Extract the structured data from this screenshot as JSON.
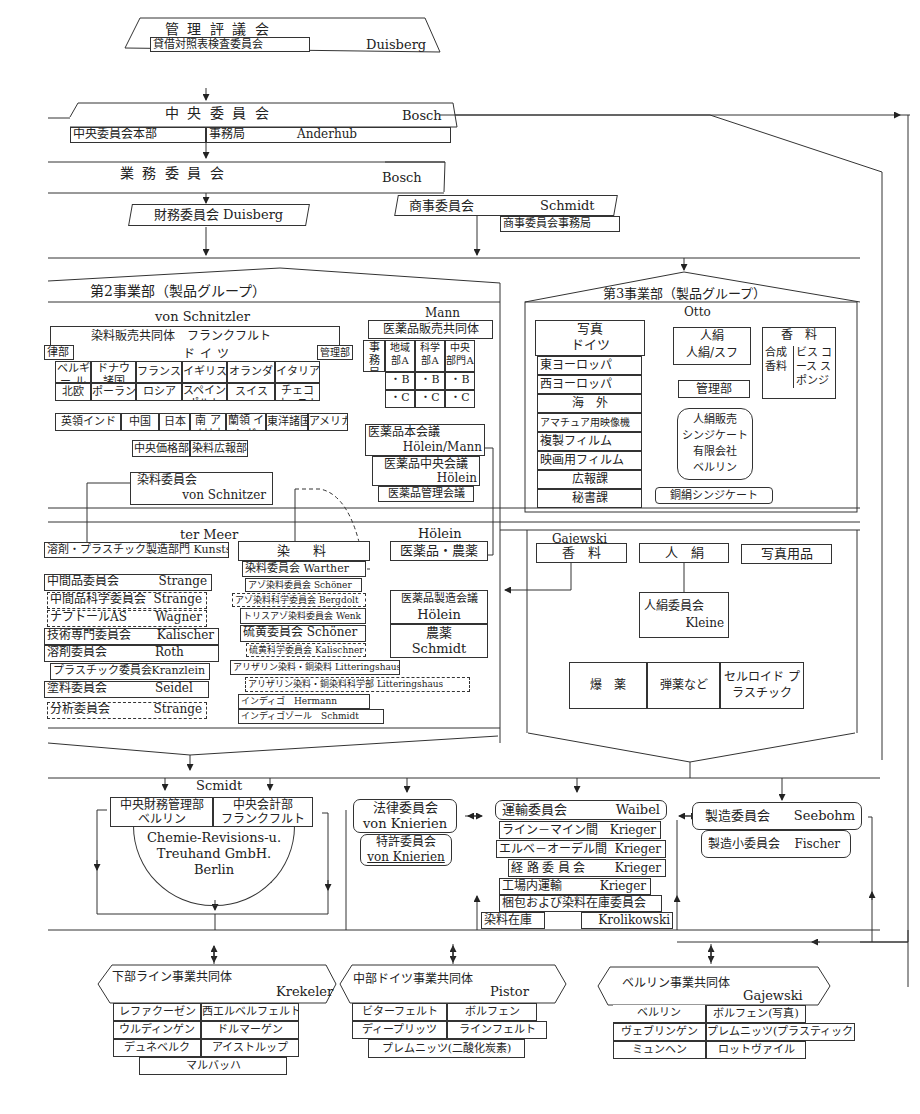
{
  "top": {
    "mgmt_council": {
      "title": "管理評議会",
      "sub": "貸借対照表検査委員会",
      "head": "Duisberg"
    },
    "central_committee": {
      "title": "中央委員会",
      "head": "Bosch",
      "hq": "中央委員会本部",
      "office": "事務局",
      "office_head": "Anderhub"
    },
    "business_committee": {
      "title": "業務委員会",
      "head": "Bosch"
    },
    "finance_committee": {
      "title": "財務委員会",
      "head": "Duisberg"
    },
    "commerce_committee": {
      "title": "商事委員会",
      "head": "Schmidt",
      "office": "商事委員会事務局"
    }
  },
  "div2": {
    "title": "第2事業部（製品グループ）",
    "head": "von Schnitzler",
    "dye_sales": {
      "title": "染料販売共同体　フランクフルト",
      "legal": "律部",
      "germany": "ドイツ",
      "admin": "管理部",
      "row1": [
        "ベルギー ルクセンブルク",
        "ドナウ 諸国",
        "フランス",
        "イギリス",
        "オランダ",
        "イタリア"
      ],
      "row2": [
        "北欧",
        "ポーランド",
        "ロシア",
        "スペイン ポルトガル",
        "スイス",
        "チェコ オーストリア"
      ],
      "row3": [
        "英領インド",
        "中国",
        "日本",
        "南 アメリカ",
        "蘭領 インド",
        "東洋諸国",
        "アメリカ"
      ],
      "row4": [
        "中央価格部",
        "染料広報部"
      ]
    },
    "pharma": {
      "head": "Mann",
      "title": "医薬品販売共同体",
      "cols": [
        "事務局",
        "地域部A",
        "科学部A",
        "中央部門A"
      ],
      "row_b": [
        "・B",
        "・B",
        "・B"
      ],
      "row_c": [
        "・C",
        "・C",
        "・C"
      ],
      "council": "医薬品本会議",
      "council_head": "Hölein/Mann",
      "central": "医薬品中央会議",
      "central_head": "Hölein",
      "mgmt": "医薬品管理会議"
    },
    "dye_committee": {
      "title": "染料委員会",
      "head": "von Schnitzer"
    }
  },
  "div3": {
    "title": "第3事業部（製品グループ）",
    "head": "Otto",
    "photo": {
      "title": "写真",
      "sub": "ドイツ",
      "items": [
        "東ヨーロッパ",
        "西ヨーロッパ",
        "海　外",
        "アマチュア用映像機",
        "複製フィルム",
        "映画用フィルム",
        "広報課",
        "秘書課"
      ]
    },
    "rayon": {
      "title": "人絹",
      "sub": "人絹/スフ"
    },
    "fragrance": {
      "title": "香　料",
      "left": "合成 香料",
      "right": "ビス コース スポンジ"
    },
    "admin": "管理部",
    "rayon_sales": [
      "人絹販売",
      "シンジケート",
      "有限会社",
      "ベルリン"
    ],
    "copper_rayon": "銅絹シンジケート"
  },
  "div1": {
    "head": "ter Meer",
    "solvent_plastic": "溶剤・プラスチック製造部門 Kunstst",
    "committees": [
      {
        "name": "中間品委員会",
        "head": "Strange",
        "dashed": false
      },
      {
        "name": "中間品科学委員会",
        "head": "Strange",
        "dashed": true
      },
      {
        "name": "ナフトールAS",
        "head": "Wagner",
        "dashed": true
      },
      {
        "name": "技術専門委員会",
        "head": "Kalischer",
        "dashed": false
      },
      {
        "name": "溶剤委員会",
        "head": "Roth",
        "dashed": false
      },
      {
        "name": "プラスチック委員会",
        "head": "Kranzlein",
        "dashed": false
      },
      {
        "name": "塗料委員会",
        "head": "Seidel",
        "dashed": false
      },
      {
        "name": "分析委員会",
        "head": "Strange",
        "dashed": true
      }
    ],
    "dyes": {
      "title": "染　料",
      "items": [
        {
          "name": "染料委員会",
          "head": "Warther"
        },
        {
          "name": "アゾ染料委員会",
          "head": "Schöner"
        },
        {
          "name": "アゾ染料科学委員会",
          "head": "Bergdolt"
        },
        {
          "name": "トリスアゾ染料委員会",
          "head": "Wenk"
        },
        {
          "name": "硫黄委員会",
          "head": "Schöner"
        },
        {
          "name": "硫黄科学委員会",
          "head": "Kalischner"
        },
        {
          "name": "アリザリン染料・銅染料",
          "head": "Litteringshaus"
        },
        {
          "name": "アリザリン染料・銅染料科学部",
          "head": "Litteringshaus"
        },
        {
          "name": "インディゴ",
          "head": "Hermann"
        },
        {
          "name": "インディゴゾール",
          "head": "Schmidt"
        }
      ]
    },
    "pharma_agri": {
      "head": "Hölein",
      "title": "医薬品・農薬",
      "mfg": "医薬品製造会議",
      "mfg_head": "Hölein",
      "agri": "農薬",
      "agri_head": "Schmidt"
    },
    "gajewski": {
      "head": "Gajewski",
      "fragrance": "香　料",
      "rayon": "人　絹",
      "photo": "写真用品",
      "rayon_comm": "人絹委員会",
      "rayon_head": "Kleine",
      "explosives": "爆　薬",
      "ammo": "弾薬など",
      "celluloid": "セルロイド プラスチック"
    }
  },
  "lower": {
    "finance": {
      "head": "Scmidt",
      "central_fin": "中央財務管理部",
      "central_fin_city": "ベルリン",
      "central_acct": "中央会計部",
      "central_acct_city": "フランクフルト",
      "trust": [
        "Chemie-Revisions-u.",
        "Treuhand GmbH.",
        "Berlin"
      ]
    },
    "legal": {
      "title": "法律委員会",
      "head": "von Knierien",
      "patent": "特許委員会",
      "patent_head": "von Knierien"
    },
    "transport": {
      "title": "運輸委員会",
      "head": "Waibel",
      "items": [
        {
          "name": "ライン－マイン間",
          "head": "Krieger"
        },
        {
          "name": "エルベ－オーデル間",
          "head": "Krieger"
        },
        {
          "name": "経路委員会",
          "head": "Krieger"
        },
        {
          "name": "工場内運輸",
          "head": "Krieger"
        }
      ],
      "packing": "梱包および染料在庫委員会",
      "stock": "染料在庫",
      "stock_head": "Krolikowski"
    },
    "manufacturing": {
      "title": "製造委員会",
      "head": "Seebohm",
      "sub": "製造小委員会",
      "sub_head": "Fischer"
    }
  },
  "regions": [
    {
      "title": "下部ライン事業共同体",
      "head": "Krekeler",
      "rows": [
        [
          "レファクーゼン",
          "西エルベルフェルト"
        ],
        [
          "ウルディンゲン",
          "ドルマーゲン"
        ],
        [
          "デュネベルク",
          "アイストルップ"
        ]
      ],
      "extra": "マルバッハ"
    },
    {
      "title": "中部ドイツ事業共同体",
      "head": "Pistor",
      "rows": [
        [
          "ビターフェルト",
          "ボルフェン"
        ],
        [
          "ディープリッツ",
          "ラインフェルト"
        ]
      ],
      "extra": "プレムニッツ(二酸化炭素)"
    },
    {
      "title": "ベルリン事業共同体",
      "head": "Gajewski",
      "rows": [
        [
          "ベルリン",
          "ボルフェン(写真)"
        ],
        [
          "ヴェブリンゲン",
          "プレムニッツ(プラスティック)"
        ],
        [
          "ミュンヘン",
          "ロットヴァイル"
        ]
      ]
    }
  ]
}
